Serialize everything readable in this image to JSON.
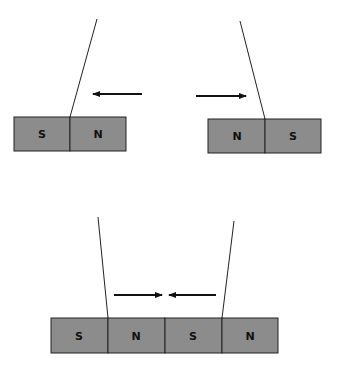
{
  "diagram": {
    "top_left_magnet": {
      "poles": [
        "S",
        "N"
      ],
      "force_arrow": "left"
    },
    "top_right_magnet": {
      "poles": [
        "N",
        "S"
      ],
      "force_arrow": "right"
    },
    "bottom_pair": {
      "magnet_left": {
        "poles": [
          "S",
          "N"
        ]
      },
      "magnet_right": {
        "poles": [
          "S",
          "N"
        ]
      },
      "force_arrows": [
        "right",
        "left"
      ]
    },
    "colors": {
      "magnet_fill": "#8c8c8c",
      "outline": "#222222",
      "background": "#ffffff"
    }
  }
}
